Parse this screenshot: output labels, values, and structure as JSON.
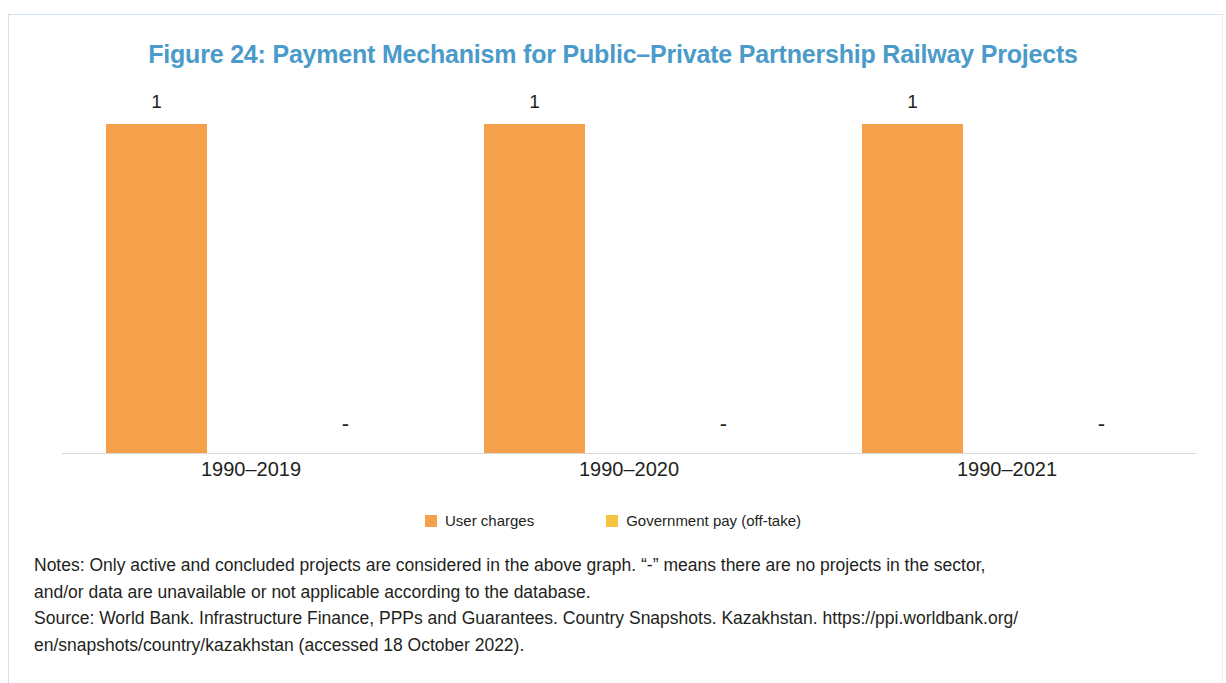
{
  "figure": {
    "title": "Figure 24: Payment Mechanism for Public–Private Partnership Railway Projects",
    "title_color": "#4a9bc9",
    "border_color": "#cfe3f2"
  },
  "legend": {
    "items": [
      {
        "label": "User charges",
        "color": "#f5a04a",
        "swatch_name": "legend-swatch-user-charges"
      },
      {
        "label": "Government pay (off-take)",
        "color": "#f5c242",
        "swatch_name": "legend-swatch-government-pay"
      }
    ]
  },
  "footnotes": {
    "lines": [
      "Notes: Only active and concluded projects are considered in the above graph. “-” means there are no projects in the sector,",
      "and/or data are unavailable or not applicable according to the database.",
      "Source: World Bank. Infrastructure Finance, PPPs and Guarantees. Country Snapshots. Kazakhstan. https://ppi.worldbank.org/",
      "en/snapshots/country/kazakhstan (accessed 18 October 2022)."
    ]
  },
  "chart_data": {
    "type": "bar",
    "title": "Figure 24: Payment Mechanism for Public–Private Partnership Railway Projects",
    "xlabel": "",
    "ylabel": "",
    "ylim": [
      0,
      1.12
    ],
    "grid": false,
    "legend_position": "bottom",
    "axis_visible": {
      "x": true,
      "y": false
    },
    "categories": [
      "1990–2019",
      "1990–2020",
      "1990–2021"
    ],
    "series": [
      {
        "name": "User charges",
        "color": "#f5a04a",
        "values": [
          1,
          1,
          1
        ],
        "labels": [
          "1",
          "1",
          "1"
        ]
      },
      {
        "name": "Government pay (off-take)",
        "color": "#f5c242",
        "values": [
          null,
          null,
          null
        ],
        "labels": [
          "-",
          "-",
          "-"
        ]
      }
    ]
  }
}
